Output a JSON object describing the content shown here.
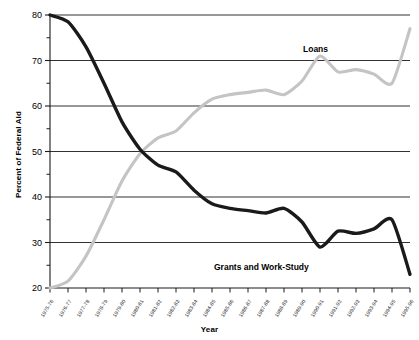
{
  "chart_data": {
    "type": "line",
    "title": "",
    "xlabel": "Year",
    "ylabel": "Percent of Federal Aid",
    "ylim": [
      20,
      80
    ],
    "ytick_values": [
      20,
      30,
      40,
      50,
      60,
      70,
      80
    ],
    "yminor_values": [
      25,
      35,
      45,
      55,
      65,
      75
    ],
    "grid": "horizontal-major",
    "legend": "inline-labels",
    "categories": [
      "1975-76",
      "1976-77",
      "1977-78",
      "1978-79",
      "1979-80",
      "1980-81",
      "1981-82",
      "1982-83",
      "1983-84",
      "1984-85",
      "1985-86",
      "1986-87",
      "1987-88",
      "1988-89",
      "1989-90",
      "1990-91",
      "1991-92",
      "1992-93",
      "1993-94",
      "1994-95",
      "1995-96"
    ],
    "series": [
      {
        "name": "Grants and Work-Study",
        "color": "#1a1a1a",
        "values": [
          80.0,
          78.5,
          73.0,
          65.0,
          56.5,
          50.5,
          47.0,
          45.5,
          41.5,
          38.5,
          37.5,
          37.0,
          36.5,
          37.5,
          34.5,
          29.0,
          32.5,
          32.0,
          33.0,
          35.0,
          23.0
        ]
      },
      {
        "name": "Loans",
        "color": "#c4c4c4",
        "values": [
          20.0,
          21.5,
          27.0,
          35.0,
          43.5,
          49.5,
          53.0,
          54.5,
          58.5,
          61.5,
          62.5,
          63.0,
          63.5,
          62.5,
          65.5,
          71.0,
          67.5,
          68.0,
          67.0,
          65.0,
          77.0
        ]
      }
    ]
  },
  "labels": {
    "loans": "Loans",
    "grants": "Grants and Work-Study"
  }
}
